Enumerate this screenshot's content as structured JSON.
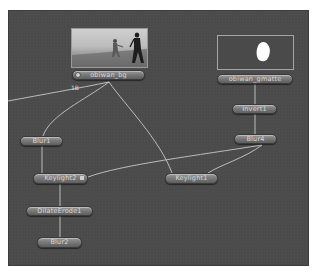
{
  "canvas": {
    "background_color": "#4b4b4b",
    "wire_color": "#c8c8c8"
  },
  "nodes": {
    "obiwan_bg": {
      "label": "obiwan_bg",
      "icon": "read-icon",
      "thumbnail": "actors-on-gray-stage"
    },
    "obiwan_gmatte": {
      "label": "obiwan_gmatte",
      "thumbnail": "white-matte-blob"
    },
    "invert1": {
      "label": "Invert1"
    },
    "blur4": {
      "label": "Blur4"
    },
    "blur1": {
      "label": "Blur1"
    },
    "keylight2": {
      "label": "Keylight2"
    },
    "keylight1": {
      "label": "Keylight1"
    },
    "dilateerode1": {
      "label": "DilateErode1"
    },
    "blur2": {
      "label": "Blur2"
    }
  },
  "annotations": {
    "input_label": "1B"
  }
}
